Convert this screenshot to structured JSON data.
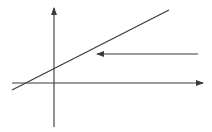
{
  "diagram": {
    "background": "#ffffff",
    "stroke_color": "#3a3a3a",
    "axes": {
      "x_axis": {
        "x1": 12,
        "y1": 83,
        "x2": 203,
        "y2": 83,
        "arrow": "right"
      },
      "y_axis": {
        "x1": 54,
        "y1": 127,
        "x2": 54,
        "y2": 8,
        "arrow": "up"
      }
    },
    "line": {
      "x1": 12,
      "y1": 90,
      "x2": 169,
      "y2": 10,
      "slope": "positive"
    },
    "arrow": {
      "x1": 198,
      "y1": 54,
      "x2": 97,
      "y2": 54,
      "direction": "left"
    }
  }
}
